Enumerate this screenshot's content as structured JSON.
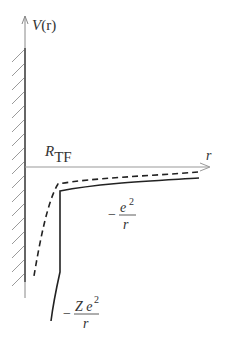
{
  "diagram": {
    "y_axis_label": {
      "main": "V",
      "arg": "(r)"
    },
    "x_axis_label": "r",
    "radius_label": {
      "main": "R",
      "sub": "TF"
    },
    "outer_potential_label": {
      "sign": "−",
      "numerator": "e",
      "power": "2",
      "denominator": "r"
    },
    "inner_potential_label": {
      "sign": "−",
      "numerator": "Z e",
      "power": "2",
      "denominator": "r"
    },
    "curves": [
      {
        "name": "solid-potential",
        "style": "solid",
        "color": "#222222"
      },
      {
        "name": "dashed-potential",
        "style": "dashed",
        "color": "#222222"
      }
    ],
    "colors": {
      "axis": "#888888",
      "wall": "#555555",
      "hatch": "#999999",
      "text": "#333333"
    }
  }
}
